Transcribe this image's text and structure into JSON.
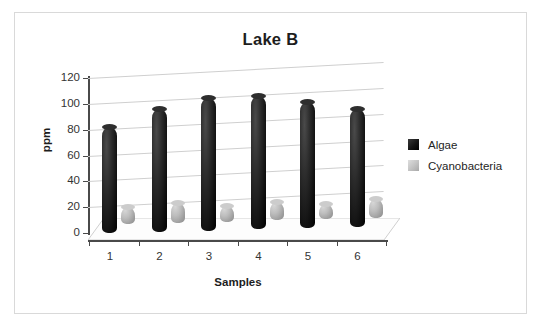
{
  "chart_data": {
    "type": "bar",
    "title": "Lake B",
    "xlabel": "Samples",
    "ylabel": "ppm",
    "categories": [
      "1",
      "2",
      "3",
      "4",
      "5",
      "6"
    ],
    "series": [
      {
        "name": "Algae",
        "values": [
          82,
          95,
          103,
          103,
          98,
          91
        ],
        "color": "#111111"
      },
      {
        "name": "Cyanobacteria",
        "values": [
          13,
          15,
          12,
          14,
          12,
          15
        ],
        "color": "#b0b0b0"
      }
    ],
    "ylim": [
      0,
      120
    ],
    "ytick_labels": [
      "120",
      "100",
      "80",
      "60",
      "40",
      "20",
      "0"
    ],
    "ytick_values": [
      120,
      100,
      80,
      60,
      40,
      20,
      0
    ],
    "grid": true,
    "legend_position": "right",
    "style": "3d-cylinder"
  },
  "legend": {
    "entries": [
      {
        "label": "Algae",
        "swatch": "algae-swatch"
      },
      {
        "label": "Cyanobacteria",
        "swatch": "cyanobacteria-swatch"
      }
    ]
  },
  "colors": {
    "algae": "#111111",
    "cyanobacteria": "#b0b0b0",
    "axis": "#4a4a4a",
    "gridline": "#cfcfcf",
    "frame": "#d9d9d9",
    "text": "#333333"
  }
}
